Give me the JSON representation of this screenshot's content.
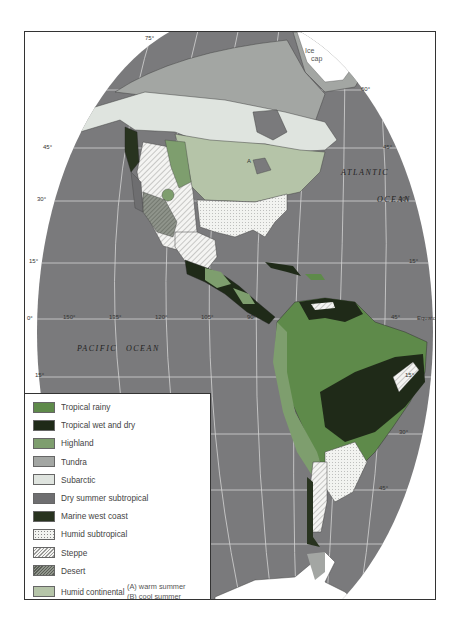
{
  "map": {
    "title": "Climate regions of the Americas",
    "colors": {
      "ocean": "#7a7a7c",
      "graticule": "#d8d8d8",
      "tropical_rainy": "#5e8a4a",
      "tropical_wet_dry": "#1f2a18",
      "highland": "#7e9e6e",
      "tundra": "#a3a6a3",
      "subarctic": "#dfe4df",
      "dry_summer_subtropical": "#6e6e70",
      "marine_west_coast": "#28331f",
      "humid_subtropical": "#f0f2ef",
      "steppe": "#f2f2f0",
      "desert": "#8a8f86",
      "humid_continental": "#b5c4a8",
      "ice_cap": "#ffffff"
    },
    "labels": {
      "ice_cap": [
        "Ice",
        "cap"
      ],
      "atlantic": "ATLANTIC",
      "atlantic_ocean": "OCEAN",
      "pacific": "PACIFIC",
      "pacific_ocean": "OCEAN",
      "equator": "Equator",
      "region_a": "A"
    },
    "longitude_ticks": [
      "150°",
      "135°",
      "120°",
      "105°",
      "90°",
      "45°"
    ],
    "latitude_ticks": {
      "left": [
        "45°",
        "30°",
        "15°",
        "0°",
        "15°"
      ],
      "right": [
        "60°",
        "45°",
        "30°",
        "15°",
        "15°",
        "30°",
        "45°"
      ],
      "top": "75°"
    }
  },
  "legend": {
    "items": [
      {
        "label": "Tropical rainy",
        "key": "tropical_rainy"
      },
      {
        "label": "Tropical wet and dry",
        "key": "tropical_wet_dry"
      },
      {
        "label": "Highland",
        "key": "highland"
      },
      {
        "label": "Tundra",
        "key": "tundra"
      },
      {
        "label": "Subarctic",
        "key": "subarctic"
      },
      {
        "label": "Dry summer subtropical",
        "key": "dry_summer_subtropical"
      },
      {
        "label": "Marine west coast",
        "key": "marine_west_coast"
      },
      {
        "label": "Humid subtropical",
        "key": "humid_subtropical"
      },
      {
        "label": "Steppe",
        "key": "steppe"
      },
      {
        "label": "Desert",
        "key": "desert"
      },
      {
        "label": "Humid continental",
        "key": "humid_continental"
      }
    ],
    "humid_continental_sub": [
      "(A) warm summer",
      "(B) cool summer"
    ]
  }
}
